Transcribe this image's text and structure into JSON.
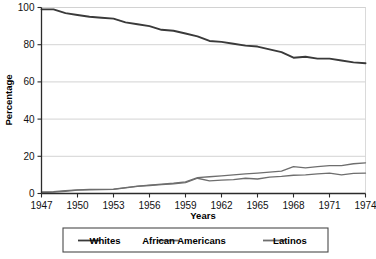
{
  "chart_data": {
    "type": "line",
    "title": "",
    "xlabel": "Years",
    "ylabel": "Percentage",
    "xlim": [
      1947,
      1974
    ],
    "ylim": [
      0,
      100
    ],
    "grid": true,
    "legend_position": "bottom",
    "xticks": [
      1947,
      1950,
      1953,
      1956,
      1959,
      1962,
      1965,
      1968,
      1971,
      1974
    ],
    "yticks": [
      0,
      20,
      40,
      60,
      80,
      100
    ],
    "x": [
      1947,
      1948,
      1949,
      1950,
      1951,
      1952,
      1953,
      1954,
      1955,
      1956,
      1957,
      1958,
      1959,
      1960,
      1961,
      1962,
      1963,
      1964,
      1965,
      1966,
      1967,
      1968,
      1969,
      1970,
      1971,
      1972,
      1973,
      1974
    ],
    "series": [
      {
        "name": "Whites",
        "color": "#3a3a3a",
        "values": [
          99,
          99,
          97,
          96,
          95,
          94.5,
          94,
          92,
          91,
          90,
          88,
          87.5,
          86,
          84.5,
          82,
          81.5,
          80.5,
          79.5,
          79,
          77.5,
          76,
          73,
          73.5,
          72.5,
          72.5,
          71.5,
          70.5,
          70
        ]
      },
      {
        "name": "African Americans",
        "color": "#6e6e6e",
        "values": [
          0.8,
          1,
          1.5,
          2,
          2.2,
          2.2,
          2.3,
          3.2,
          4,
          4.5,
          5,
          5.5,
          6.2,
          8.5,
          9,
          9.5,
          10,
          10.5,
          11,
          11.5,
          12,
          14.5,
          13.8,
          14.5,
          15,
          15,
          16,
          16.5
        ]
      },
      {
        "name": "Latinos",
        "color": "#6e6e6e",
        "values": [
          0.5,
          0.7,
          1.2,
          1.8,
          2,
          2.1,
          2.2,
          3,
          3.8,
          4.3,
          4.8,
          5.2,
          5.8,
          8.2,
          6.8,
          7.2,
          7.5,
          8.2,
          7.8,
          8.8,
          9.2,
          9.8,
          10,
          10.5,
          11,
          10,
          10.8,
          11
        ]
      }
    ]
  },
  "legend": {
    "items": [
      {
        "label": "Whites"
      },
      {
        "label": "African Americans"
      },
      {
        "label": "Latinos"
      }
    ]
  },
  "axes": {
    "x_title": "Years",
    "y_title": "Percentage"
  }
}
